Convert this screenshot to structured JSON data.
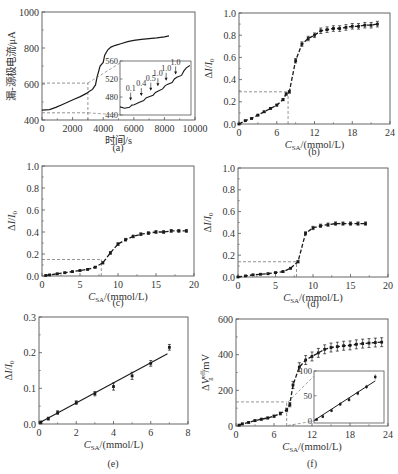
{
  "figure": {
    "background": "#ffffff",
    "ink_color": "#1a1a1a",
    "frame_color": "#555555",
    "guide_color": "#666666"
  },
  "chart_data": [
    {
      "id": "a",
      "panel_label": "(a)",
      "type": "line",
      "title": "",
      "xlabel": "时间/s",
      "ylabel": "漏-源极电流/μA",
      "xlim": [
        0,
        10000
      ],
      "ylim": [
        400,
        1000
      ],
      "xticks": [
        0,
        2000,
        4000,
        6000,
        8000,
        10000
      ],
      "xtick_labels": [
        "0",
        "2000",
        "4000",
        "6000",
        "8000",
        "10000"
      ],
      "yticks": [
        400,
        600,
        800,
        1000
      ],
      "ytick_labels": [
        "400",
        "600",
        "800",
        "1000"
      ],
      "grid": false,
      "series": [
        {
          "name": "drain-source current (stepwise)",
          "style": "solid",
          "x": [
            0,
            500,
            900,
            1300,
            1700,
            2100,
            2500,
            2900,
            3100,
            3300,
            3500,
            3600,
            3800,
            4000,
            4100,
            4300,
            4500,
            4800,
            5200,
            5600,
            6000,
            6500,
            7000,
            7500,
            8000,
            8300
          ],
          "y": [
            455,
            458,
            470,
            485,
            500,
            515,
            530,
            548,
            560,
            570,
            595,
            640,
            700,
            720,
            760,
            790,
            805,
            815,
            825,
            835,
            842,
            848,
            852,
            856,
            862,
            868
          ]
        }
      ],
      "guides": [
        {
          "type": "hline-dashed",
          "y": 605,
          "x_from": 0,
          "x_to": 3000
        },
        {
          "type": "vline-dashed",
          "x": 3000,
          "y_from": 400,
          "y_to": 605
        },
        {
          "type": "hline-dashed",
          "y": 440,
          "x_from": 0,
          "x_to": 3000
        }
      ],
      "inset": {
        "xlim": [
          0,
          3000
        ],
        "ylim": [
          440,
          560
        ],
        "yticks": [
          440,
          480,
          520,
          560
        ],
        "ytick_labels": [
          "440",
          "480",
          "520",
          "560"
        ],
        "x": [
          0,
          200,
          400,
          500,
          600,
          800,
          1000,
          1100,
          1200,
          1400,
          1500,
          1600,
          1800,
          1900,
          2000,
          2200,
          2300,
          2400,
          2600,
          2700,
          2800,
          2950
        ],
        "y": [
          458,
          455,
          457,
          462,
          463,
          468,
          472,
          478,
          480,
          484,
          490,
          493,
          498,
          505,
          508,
          512,
          520,
          524,
          528,
          538,
          545,
          550
        ],
        "annotations": [
          {
            "text": "0.1",
            "x": 450,
            "y": 472
          },
          {
            "text": "0.4",
            "x": 900,
            "y": 482
          },
          {
            "text": "0.5",
            "x": 1300,
            "y": 494
          },
          {
            "text": "1.0",
            "x": 1600,
            "y": 504
          },
          {
            "text": "1.0",
            "x": 1950,
            "y": 516
          },
          {
            "text": "1.0",
            "x": 2350,
            "y": 530
          }
        ]
      }
    },
    {
      "id": "b",
      "panel_label": "(b)",
      "type": "scatter",
      "title": "",
      "xlabel": "C_SA/(mmol/L)",
      "ylabel": "ΔI/I0",
      "xlim": [
        0,
        24
      ],
      "ylim": [
        0.0,
        1.0
      ],
      "xticks": [
        0,
        6,
        12,
        18,
        24
      ],
      "xtick_labels": [
        "0",
        "6",
        "12",
        "18",
        "24"
      ],
      "yticks": [
        0.0,
        0.2,
        0.4,
        0.6,
        0.8,
        1.0
      ],
      "ytick_labels": [
        "0.0",
        "0.2",
        "0.4",
        "0.6",
        "0.8",
        "1.0"
      ],
      "grid": false,
      "series": [
        {
          "name": "data",
          "style": "markers-errorbars-dashed",
          "x": [
            0,
            1,
            2,
            3,
            4,
            5,
            6,
            7,
            7.5,
            8,
            9,
            10,
            11,
            12,
            13,
            14,
            15,
            16,
            17,
            18,
            19,
            20,
            21,
            22
          ],
          "y": [
            0.0,
            0.03,
            0.05,
            0.08,
            0.11,
            0.14,
            0.17,
            0.22,
            0.27,
            0.29,
            0.57,
            0.72,
            0.77,
            0.8,
            0.84,
            0.85,
            0.86,
            0.86,
            0.87,
            0.88,
            0.88,
            0.89,
            0.89,
            0.9
          ],
          "err": [
            0.005,
            0.005,
            0.005,
            0.006,
            0.006,
            0.007,
            0.008,
            0.01,
            0.01,
            0.012,
            0.02,
            0.02,
            0.02,
            0.02,
            0.025,
            0.025,
            0.025,
            0.025,
            0.025,
            0.025,
            0.025,
            0.025,
            0.025,
            0.025
          ]
        }
      ],
      "guides": [
        {
          "type": "hline-dashed",
          "y": 0.29,
          "x_from": 0,
          "x_to": 7.8
        },
        {
          "type": "vline-dashed",
          "x": 7.8,
          "y_from": 0,
          "y_to": 0.29
        }
      ]
    },
    {
      "id": "c",
      "panel_label": "(c)",
      "type": "scatter",
      "title": "",
      "xlabel": "C_SA/(mmol/L)",
      "ylabel": "ΔI/I0",
      "xlim": [
        0,
        20
      ],
      "ylim": [
        0.0,
        1.0
      ],
      "xticks": [
        0,
        5,
        10,
        15,
        20
      ],
      "xtick_labels": [
        "0",
        "5",
        "10",
        "15",
        "20"
      ],
      "yticks": [
        0.0,
        0.2,
        0.4,
        0.6,
        0.8,
        1.0
      ],
      "ytick_labels": [
        "0.0",
        "0.2",
        "0.4",
        "0.6",
        "0.8",
        "1.0"
      ],
      "grid": false,
      "series": [
        {
          "name": "data",
          "style": "markers-errorbars-dashed",
          "x": [
            0.5,
            1,
            2,
            3,
            4,
            5,
            6,
            7,
            8,
            9,
            10,
            11,
            12,
            13,
            14,
            15,
            16,
            17,
            18,
            19
          ],
          "y": [
            0.005,
            0.01,
            0.02,
            0.03,
            0.04,
            0.05,
            0.06,
            0.08,
            0.12,
            0.21,
            0.29,
            0.33,
            0.36,
            0.38,
            0.39,
            0.4,
            0.4,
            0.41,
            0.41,
            0.41
          ],
          "err": [
            0.004,
            0.004,
            0.004,
            0.005,
            0.005,
            0.005,
            0.006,
            0.007,
            0.01,
            0.012,
            0.012,
            0.012,
            0.012,
            0.012,
            0.012,
            0.012,
            0.012,
            0.012,
            0.012,
            0.012
          ]
        }
      ],
      "guides": [
        {
          "type": "hline-dashed",
          "y": 0.15,
          "x_from": 0,
          "x_to": 7.8
        },
        {
          "type": "vline-dashed",
          "x": 7.8,
          "y_from": 0,
          "y_to": 0.15
        }
      ]
    },
    {
      "id": "d",
      "panel_label": "(d)",
      "type": "scatter",
      "title": "",
      "xlabel": "C_SA/(mmol/L)",
      "ylabel": "ΔI/I0",
      "xlim": [
        0,
        20
      ],
      "ylim": [
        0.0,
        1.0
      ],
      "xticks": [
        0,
        5,
        10,
        15,
        20
      ],
      "xtick_labels": [
        "0",
        "5",
        "10",
        "15",
        "20"
      ],
      "yticks": [
        0.0,
        0.2,
        0.4,
        0.6,
        0.8,
        1.0
      ],
      "ytick_labels": [
        "0.0",
        "0.2",
        "0.4",
        "0.6",
        "0.8",
        "1.0"
      ],
      "grid": false,
      "series": [
        {
          "name": "data",
          "style": "markers-errorbars-dashed",
          "x": [
            0,
            1,
            2,
            3,
            4,
            5,
            6,
            7,
            8,
            9,
            10,
            11,
            12,
            13,
            14,
            15,
            16,
            17
          ],
          "y": [
            0.0,
            0.01,
            0.02,
            0.025,
            0.03,
            0.04,
            0.05,
            0.08,
            0.14,
            0.4,
            0.45,
            0.47,
            0.48,
            0.49,
            0.49,
            0.49,
            0.49,
            0.49
          ],
          "err": [
            0.004,
            0.004,
            0.004,
            0.004,
            0.005,
            0.005,
            0.006,
            0.007,
            0.01,
            0.015,
            0.015,
            0.015,
            0.015,
            0.015,
            0.015,
            0.015,
            0.015,
            0.015
          ]
        }
      ],
      "guides": [
        {
          "type": "hline-dashed",
          "y": 0.14,
          "x_from": 0,
          "x_to": 7.8
        },
        {
          "type": "vline-dashed",
          "x": 7.8,
          "y_from": 0,
          "y_to": 0.14
        }
      ]
    },
    {
      "id": "e",
      "panel_label": "(e)",
      "type": "scatter",
      "title": "",
      "xlabel": "C_SA/(mmol/L)",
      "ylabel": "ΔI/I0",
      "xlim": [
        0,
        8
      ],
      "ylim": [
        0.0,
        0.3
      ],
      "xticks": [
        0,
        2,
        4,
        6,
        8
      ],
      "xtick_labels": [
        "0",
        "2",
        "4",
        "6",
        "8"
      ],
      "yticks": [
        0.0,
        0.1,
        0.2,
        0.3
      ],
      "ytick_labels": [
        "0.0",
        "0.1",
        "0.2",
        "0.3"
      ],
      "grid": false,
      "series": [
        {
          "name": "data",
          "style": "markers-errorbars",
          "x": [
            0.1,
            0.5,
            1,
            2,
            3,
            4,
            5,
            6,
            7
          ],
          "y": [
            0.005,
            0.015,
            0.032,
            0.06,
            0.085,
            0.105,
            0.135,
            0.17,
            0.215
          ],
          "err": [
            0.003,
            0.004,
            0.005,
            0.005,
            0.006,
            0.01,
            0.01,
            0.008,
            0.008
          ]
        },
        {
          "name": "linear fit",
          "style": "solid-line",
          "x": [
            0,
            6.9
          ],
          "y": [
            0.003,
            0.197
          ]
        }
      ]
    },
    {
      "id": "f",
      "panel_label": "(f)",
      "type": "scatter",
      "title": "",
      "xlabel": "C_SA/(mmol/L)",
      "ylabel": "ΔV_g^eff/mV",
      "xlim": [
        0,
        24
      ],
      "ylim": [
        0,
        600
      ],
      "xticks": [
        0,
        6,
        12,
        18,
        24
      ],
      "xtick_labels": [
        "0",
        "6",
        "12",
        "18",
        "24"
      ],
      "yticks": [
        0,
        200,
        400,
        600
      ],
      "ytick_labels": [
        "0",
        "200",
        "400",
        "600"
      ],
      "grid": false,
      "series": [
        {
          "name": "data",
          "style": "markers-errorbars-dashed",
          "x": [
            0.5,
            1,
            2,
            3,
            4,
            5,
            6,
            7,
            8,
            8.5,
            9,
            10,
            11,
            12,
            13,
            14,
            15,
            16,
            17,
            18,
            19,
            20,
            21,
            22,
            23
          ],
          "y": [
            5,
            12,
            20,
            30,
            38,
            45,
            55,
            70,
            90,
            120,
            230,
            330,
            370,
            390,
            410,
            430,
            440,
            445,
            450,
            452,
            458,
            462,
            465,
            468,
            470
          ],
          "err": [
            3,
            4,
            4,
            5,
            5,
            5,
            6,
            8,
            10,
            12,
            20,
            25,
            25,
            25,
            25,
            25,
            25,
            25,
            25,
            25,
            25,
            25,
            25,
            25,
            25
          ]
        }
      ],
      "guides": [
        {
          "type": "hline-dashed",
          "y": 135,
          "x_from": 0,
          "x_to": 8
        },
        {
          "type": "vline-dashed",
          "x": 8,
          "y_from": 0,
          "y_to": 135
        }
      ],
      "inset": {
        "xlim": [
          0,
          8
        ],
        "ylim": [
          -5,
          100
        ],
        "yticks": [
          0,
          50,
          100
        ],
        "ytick_labels": [
          "0",
          "50",
          "100"
        ],
        "x": [
          0.3,
          1,
          2,
          3,
          4,
          5,
          6,
          7
        ],
        "y": [
          2,
          8,
          20,
          33,
          42,
          55,
          68,
          88
        ],
        "err": [
          2,
          3,
          3,
          4,
          4,
          4,
          4,
          5
        ],
        "fit": {
          "x": [
            0,
            7
          ],
          "y": [
            0,
            80
          ]
        }
      }
    }
  ]
}
